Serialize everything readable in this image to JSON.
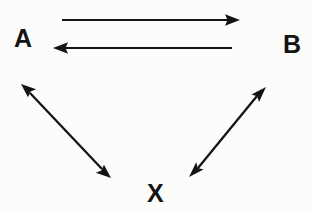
{
  "diagram": {
    "background_color": "#fcfcfb",
    "ink_color": "#111111",
    "width": 312,
    "height": 210,
    "nodes": [
      {
        "id": "A",
        "label": "A",
        "x": 23,
        "y": 38
      },
      {
        "id": "B",
        "label": "B",
        "x": 291,
        "y": 44
      },
      {
        "id": "X",
        "label": "X",
        "x": 155,
        "y": 192
      }
    ],
    "edges": [
      {
        "id": "a-to-b",
        "name": "arrow-a-to-b",
        "from": "A",
        "to": "B",
        "direction": "forward",
        "arrowheads": "end",
        "x1": 62,
        "y1": 20,
        "x2": 237,
        "y2": 20
      },
      {
        "id": "b-to-a",
        "name": "arrow-b-to-a",
        "from": "B",
        "to": "A",
        "direction": "backward",
        "arrowheads": "start",
        "x1": 232,
        "y1": 48,
        "x2": 56,
        "y2": 48
      },
      {
        "id": "a-x",
        "name": "arrow-a-x-bidirectional",
        "from": "A",
        "to": "X",
        "direction": "both",
        "arrowheads": "both",
        "x1": 22,
        "y1": 85,
        "x2": 110,
        "y2": 177
      },
      {
        "id": "b-x",
        "name": "arrow-b-x-bidirectional",
        "from": "B",
        "to": "X",
        "direction": "both",
        "arrowheads": "both",
        "x1": 265,
        "y1": 88,
        "x2": 190,
        "y2": 176
      }
    ],
    "stroke_width": 2.2
  }
}
